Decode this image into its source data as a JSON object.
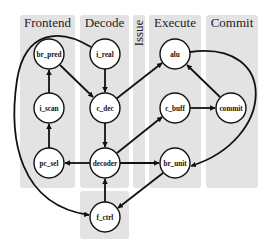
{
  "diagram": {
    "type": "pipeline-graph",
    "columns": [
      {
        "id": "frontend",
        "label": "Frontend",
        "x": 20,
        "y": 15,
        "w": 55,
        "h": 173,
        "vertical": false
      },
      {
        "id": "decode",
        "label": "Decode",
        "x": 80,
        "y": 15,
        "w": 49,
        "h": 173,
        "vertical": false
      },
      {
        "id": "issue",
        "label": "Issue",
        "x": 133,
        "y": 15,
        "w": 12,
        "h": 173,
        "vertical": true
      },
      {
        "id": "execute",
        "label": "Execute",
        "x": 149,
        "y": 15,
        "w": 52,
        "h": 173,
        "vertical": false
      },
      {
        "id": "commit",
        "label": "Commit",
        "x": 206,
        "y": 15,
        "w": 52,
        "h": 173,
        "vertical": false
      },
      {
        "id": "fctrl-box",
        "label": "",
        "x": 80,
        "y": 191,
        "w": 49,
        "h": 48,
        "vertical": false
      }
    ],
    "nodes": [
      {
        "id": "br_pred",
        "label": "br_pred",
        "cx": 49,
        "cy": 54
      },
      {
        "id": "i_scan",
        "label": "i_scan",
        "cx": 49,
        "cy": 108
      },
      {
        "id": "pc_sel",
        "label": "pc_sel",
        "cx": 49,
        "cy": 163
      },
      {
        "id": "i_real",
        "label": "i_real",
        "cx": 105,
        "cy": 54
      },
      {
        "id": "c_dec",
        "label": "c_dec",
        "cx": 105,
        "cy": 108
      },
      {
        "id": "decoder",
        "label": "decoder",
        "cx": 105,
        "cy": 163
      },
      {
        "id": "f_ctrl",
        "label": "f_ctrl",
        "cx": 105,
        "cy": 217
      },
      {
        "id": "alu",
        "label": "alu",
        "cx": 175,
        "cy": 54
      },
      {
        "id": "c_buff",
        "label": "c_buff",
        "cx": 175,
        "cy": 108
      },
      {
        "id": "br_unit",
        "label": "br_unit",
        "cx": 175,
        "cy": 163
      },
      {
        "id": "commit",
        "label": "commit",
        "cx": 231,
        "cy": 108
      }
    ],
    "edges": [
      {
        "from": "i_scan",
        "to": "br_pred",
        "d": "M49,93 L49,70"
      },
      {
        "from": "pc_sel",
        "to": "i_scan",
        "d": "M49,148 L49,124"
      },
      {
        "from": "br_pred",
        "to": "c_dec",
        "d": "M60,65 L93,97"
      },
      {
        "from": "i_real",
        "to": "c_dec",
        "d": "M105,69 L105,92"
      },
      {
        "from": "c_dec",
        "to": "decoder",
        "d": "M105,123 L105,147"
      },
      {
        "from": "c_dec",
        "to": "alu",
        "d": "M116,99 L162,63"
      },
      {
        "from": "decoder",
        "to": "pc_sel",
        "d": "M90,163 L65,163"
      },
      {
        "from": "decoder",
        "to": "c_buff",
        "d": "M117,153 L162,117"
      },
      {
        "from": "decoder",
        "to": "br_unit",
        "d": "M120,163 L159,163"
      },
      {
        "from": "f_ctrl",
        "to": "decoder",
        "d": "M105,202 L105,179"
      },
      {
        "from": "c_buff",
        "to": "commit",
        "d": "M190,108 L215,108"
      },
      {
        "from": "commit",
        "to": "alu",
        "d": "M220,97 L187,65"
      },
      {
        "from": "alu",
        "to": "br_unit",
        "d": "M190,52 C280,40 275,140 191,166"
      },
      {
        "from": "br_unit",
        "to": "f_ctrl",
        "d": "M163,173 L118,208"
      },
      {
        "from": "i_real",
        "to": "f_ctrl",
        "d": "M91,47 C60,28 25,30 17,80 C8,140 20,205 89,215"
      }
    ]
  }
}
